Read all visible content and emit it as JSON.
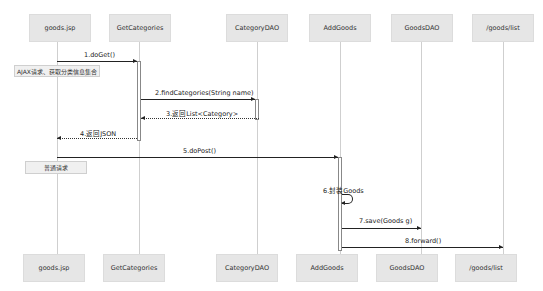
{
  "participants": [
    {
      "name": "goods.jsp",
      "x": 60
    },
    {
      "name": "GetCategories",
      "x": 140
    },
    {
      "name": "CategoryDAO",
      "x": 257
    },
    {
      "name": "AddGoods",
      "x": 340
    },
    {
      "name": "GoodsDAO",
      "x": 422
    },
    {
      "name": "/goods/list",
      "x": 503
    }
  ],
  "messages": [
    {
      "label": "1.doGet()",
      "from": "goods.jsp",
      "to": "GetCategories",
      "type": "sync"
    },
    {
      "label": "2.findCategories(String name)",
      "from": "GetCategories",
      "to": "CategoryDAO",
      "type": "sync"
    },
    {
      "label": "3.返回List<Category>",
      "from": "CategoryDAO",
      "to": "GetCategories",
      "type": "return"
    },
    {
      "label": "4.返回JSON",
      "from": "GetCategories",
      "to": "goods.jsp",
      "type": "return"
    },
    {
      "label": "5.doPost()",
      "from": "goods.jsp",
      "to": "AddGoods",
      "type": "sync"
    },
    {
      "label": "6.封装Goods",
      "from": "AddGoods",
      "to": "AddGoods",
      "type": "self"
    },
    {
      "label": "7.save(Goods g)",
      "from": "AddGoods",
      "to": "GoodsDAO",
      "type": "sync"
    },
    {
      "label": "8.forward()",
      "from": "AddGoods",
      "to": "/goods/list",
      "type": "sync"
    }
  ],
  "notes": [
    {
      "text": "AJAX请求、获取分类信息集合"
    },
    {
      "text": "普通请求"
    }
  ]
}
